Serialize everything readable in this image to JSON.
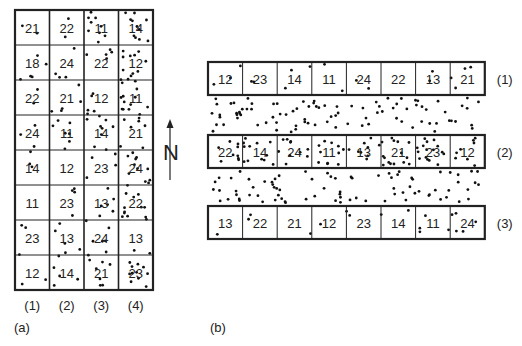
{
  "panel_a": {
    "label": "(a)",
    "column_labels": [
      "(1)",
      "(2)",
      "(3)",
      "(4)"
    ],
    "rows": [
      [
        "21",
        "22",
        "11",
        "14"
      ],
      [
        "18",
        "24",
        "22",
        "12"
      ],
      [
        "22",
        "21",
        "12",
        "11"
      ],
      [
        "24",
        "11",
        "14",
        "21"
      ],
      [
        "14",
        "12",
        "23",
        "24"
      ],
      [
        "11",
        "23",
        "13",
        "22"
      ],
      [
        "23",
        "13",
        "24",
        "13"
      ],
      [
        "12",
        "14",
        "21",
        "23"
      ]
    ]
  },
  "north_arrow": {
    "label": "N"
  },
  "panel_b": {
    "label": "(b)",
    "strips": [
      {
        "label": "(1)",
        "cells": [
          "12",
          "23",
          "14",
          "11",
          "24",
          "22",
          "13",
          "21"
        ]
      },
      {
        "label": "(2)",
        "cells": [
          "22",
          "14",
          "24",
          "11",
          "13",
          "21",
          "23",
          "12"
        ]
      },
      {
        "label": "(3)",
        "cells": [
          "13",
          "22",
          "21",
          "12",
          "23",
          "14",
          "11",
          "24"
        ]
      }
    ]
  }
}
